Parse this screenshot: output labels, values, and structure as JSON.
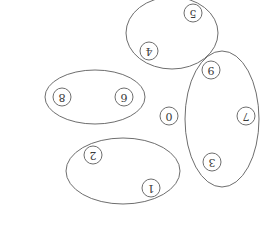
{
  "diagram": {
    "orientation": "rotated-180",
    "colors": {
      "stroke": "#6e6e6e",
      "text": "#3a3a3a",
      "background": "#ffffff"
    },
    "groups": [
      {
        "id": "group-top",
        "cx": 172,
        "cy": 33,
        "rx": 46,
        "ry": 36,
        "members": [
          "5",
          "4"
        ]
      },
      {
        "id": "group-left",
        "cx": 95,
        "cy": 97,
        "rx": 50,
        "ry": 27,
        "members": [
          "8",
          "6"
        ]
      },
      {
        "id": "group-right",
        "cx": 222,
        "cy": 119,
        "rx": 37,
        "ry": 68,
        "members": [
          "9",
          "7",
          "3"
        ]
      },
      {
        "id": "group-bottom",
        "cx": 123,
        "cy": 171,
        "rx": 57,
        "ry": 33,
        "members": [
          "2",
          "1"
        ]
      }
    ],
    "nodes": [
      {
        "label": "0",
        "x": 169,
        "y": 116
      },
      {
        "label": "1",
        "x": 151,
        "y": 188
      },
      {
        "label": "2",
        "x": 93,
        "y": 155
      },
      {
        "label": "3",
        "x": 212,
        "y": 162
      },
      {
        "label": "4",
        "x": 149,
        "y": 51
      },
      {
        "label": "5",
        "x": 193,
        "y": 13
      },
      {
        "label": "6",
        "x": 124,
        "y": 97
      },
      {
        "label": "7",
        "x": 246,
        "y": 116
      },
      {
        "label": "8",
        "x": 62,
        "y": 97
      },
      {
        "label": "9",
        "x": 211,
        "y": 70
      }
    ]
  }
}
